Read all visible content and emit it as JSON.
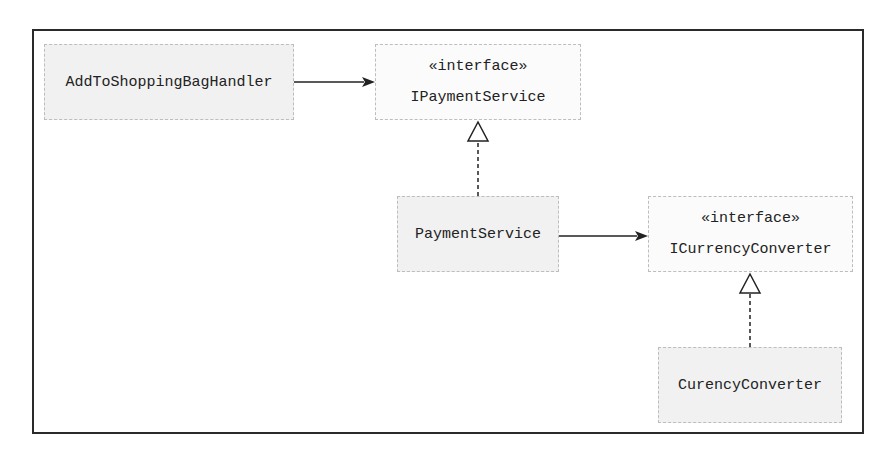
{
  "diagram": {
    "type": "UML class diagram",
    "nodes": [
      {
        "id": "add_handler",
        "name": "AddToShoppingBagHandler",
        "stereotype": null
      },
      {
        "id": "ipayment",
        "name": "IPaymentService",
        "stereotype": "«interface»"
      },
      {
        "id": "payment",
        "name": "PaymentService",
        "stereotype": null
      },
      {
        "id": "icurrency",
        "name": "ICurrencyConverter",
        "stereotype": "«interface»"
      },
      {
        "id": "currency",
        "name": "CurencyConverter",
        "stereotype": null
      }
    ],
    "edges": [
      {
        "from": "AddToShoppingBagHandler",
        "to": "IPaymentService",
        "kind": "dependency (solid arrow)"
      },
      {
        "from": "PaymentService",
        "to": "IPaymentService",
        "kind": "realization (dashed, hollow triangle)"
      },
      {
        "from": "PaymentService",
        "to": "ICurrencyConverter",
        "kind": "dependency (solid arrow)"
      },
      {
        "from": "CurencyConverter",
        "to": "ICurrencyConverter",
        "kind": "realization (dashed, hollow triangle)"
      }
    ]
  },
  "colors": {
    "frame": "#2a2a2a",
    "box_fill": "#f1f1f1",
    "box_border": "#bdbdbd",
    "line": "#222222"
  }
}
